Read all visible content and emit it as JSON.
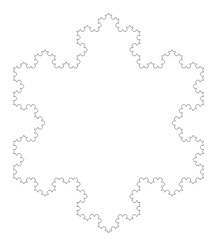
{
  "figure": {
    "kind": "koch-snowflake",
    "canvas": {
      "width": 217,
      "height": 245,
      "background_color": "#ffffff"
    },
    "stroke": {
      "color": "#808080",
      "width": 0.6
    },
    "geometry": {
      "iterations": 4,
      "sides": 3,
      "orientation": "apex-up",
      "center_x": 108.5,
      "center_y": 123.0,
      "circumradius": 110.0,
      "bounds": {
        "left": 11,
        "top": 13,
        "right": 206,
        "bottom": 233
      }
    }
  },
  "chart_data": {
    "type": "line",
    "xlabel": "",
    "ylabel": "",
    "series": [
      {
        "name": "koch-snowflake-outline",
        "iterations": 4,
        "base_vertices": [
          {
            "x": 108.5,
            "y": 13.0
          },
          {
            "x": 203.76,
            "y": 178.0
          },
          {
            "x": 13.24,
            "y": 178.0
          }
        ],
        "segment_count": 192,
        "color": "#808080"
      }
    ]
  }
}
